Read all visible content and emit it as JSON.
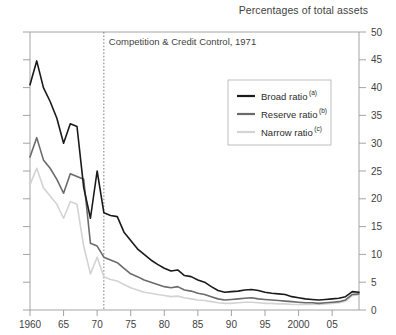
{
  "header": {
    "title": "Percentages of total assets"
  },
  "annotation": {
    "label": "Competition & Credit Control, 1971",
    "year": 1971
  },
  "legend": {
    "items": [
      {
        "label": "Broad ratio",
        "note": "(a)",
        "color": "#1a1a1a"
      },
      {
        "label": "Reserve ratio",
        "note": "(b)",
        "color": "#6b6b6b"
      },
      {
        "label": "Narrow ratio",
        "note": "(c)",
        "color": "#d3d3d3"
      }
    ]
  },
  "chart_data": {
    "type": "line",
    "title": "Percentages of total assets",
    "xlabel": "",
    "ylabel": "",
    "xlim": [
      1960,
      2009
    ],
    "ylim": [
      0,
      50
    ],
    "ytick_step": 5,
    "grid": false,
    "legend_position": "inside-top-right",
    "y_axis_side": "right",
    "yticks": [
      0,
      5,
      10,
      15,
      20,
      25,
      30,
      35,
      40,
      45,
      50
    ],
    "ytick_labels": [
      "0",
      "5",
      "10",
      "15",
      "20",
      "25",
      "30",
      "35",
      "40",
      "45",
      "50"
    ],
    "xticks": [
      1960,
      1965,
      1970,
      1975,
      1980,
      1985,
      1990,
      1995,
      2000,
      2005
    ],
    "xtick_labels": [
      "1960",
      "65",
      "70",
      "75",
      "80",
      "85",
      "90",
      "95",
      "2000",
      "05"
    ],
    "annotations": [
      {
        "text": "Competition & Credit Control, 1971",
        "x": 1971,
        "type": "vertical-dashed-line"
      }
    ],
    "x": [
      1960,
      1961,
      1962,
      1963,
      1964,
      1965,
      1966,
      1967,
      1968,
      1969,
      1970,
      1971,
      1972,
      1973,
      1974,
      1975,
      1976,
      1977,
      1978,
      1979,
      1980,
      1981,
      1982,
      1983,
      1984,
      1985,
      1986,
      1987,
      1988,
      1989,
      1990,
      1991,
      1992,
      1993,
      1994,
      1995,
      1996,
      1997,
      1998,
      1999,
      2000,
      2001,
      2002,
      2003,
      2004,
      2005,
      2006,
      2007,
      2008,
      2009
    ],
    "series": [
      {
        "name": "Broad ratio",
        "note": "(a)",
        "color": "#1a1a1a",
        "values": [
          40.5,
          44.8,
          40.0,
          37.5,
          34.5,
          30.0,
          33.5,
          33.0,
          22.0,
          16.5,
          25.0,
          17.5,
          17.0,
          16.8,
          14.0,
          12.5,
          11.0,
          10.0,
          9.0,
          8.2,
          7.5,
          7.0,
          7.2,
          6.2,
          6.0,
          5.4,
          5.0,
          4.2,
          3.5,
          3.2,
          3.3,
          3.4,
          3.6,
          3.7,
          3.5,
          3.2,
          3.0,
          2.9,
          2.8,
          2.4,
          2.2,
          2.0,
          1.9,
          1.8,
          1.9,
          2.0,
          2.1,
          2.4,
          3.3,
          3.2
        ]
      },
      {
        "name": "Reserve ratio",
        "note": "(b)",
        "color": "#6b6b6b",
        "values": [
          27.5,
          31.0,
          27.0,
          25.5,
          23.5,
          21.0,
          24.5,
          24.0,
          23.5,
          12.0,
          11.5,
          9.5,
          9.0,
          8.5,
          7.5,
          6.5,
          6.0,
          5.4,
          5.0,
          4.6,
          4.2,
          4.0,
          4.2,
          3.6,
          3.4,
          3.0,
          2.8,
          2.4,
          2.0,
          1.8,
          1.9,
          2.0,
          2.1,
          2.2,
          2.0,
          1.9,
          1.8,
          1.7,
          1.6,
          1.5,
          1.4,
          1.3,
          1.3,
          1.2,
          1.3,
          1.4,
          1.5,
          1.8,
          2.8,
          2.9
        ]
      },
      {
        "name": "Narrow ratio",
        "note": "(c)",
        "color": "#d3d3d3",
        "values": [
          22.5,
          25.5,
          22.0,
          20.5,
          19.0,
          16.5,
          19.5,
          19.0,
          11.5,
          6.5,
          9.5,
          6.0,
          5.5,
          5.2,
          4.6,
          4.0,
          3.6,
          3.2,
          3.0,
          2.8,
          2.6,
          2.4,
          2.5,
          2.2,
          2.0,
          1.8,
          1.7,
          1.5,
          1.3,
          1.2,
          1.2,
          1.3,
          1.4,
          1.4,
          1.3,
          1.2,
          1.2,
          1.1,
          1.1,
          1.0,
          1.0,
          1.0,
          1.0,
          1.0,
          1.1,
          1.2,
          1.3,
          1.6,
          2.6,
          2.7
        ]
      }
    ]
  }
}
